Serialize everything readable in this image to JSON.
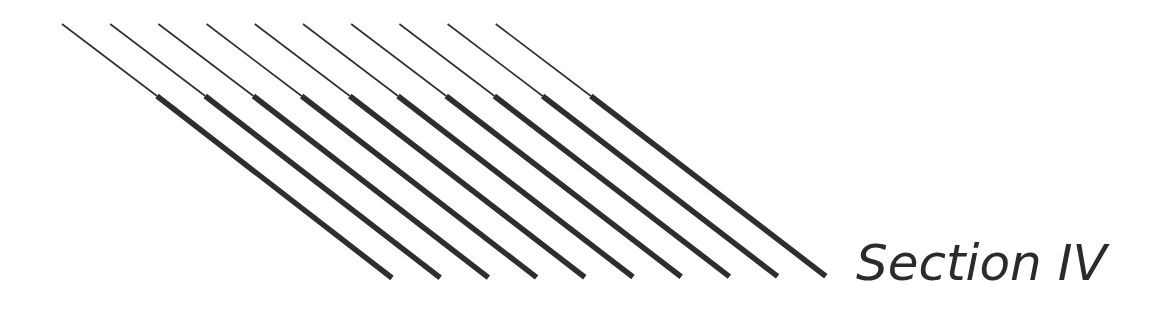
{
  "section": {
    "title": "Section IV"
  },
  "decoration": {
    "stroke_color": "#2e2e2e",
    "line_count": 10,
    "first_line": {
      "thin_start": [
        62,
        24
      ],
      "thick_start": [
        157,
        96
      ],
      "end": [
        392,
        278
      ]
    },
    "spacing_x": 48.2,
    "thin_width": 1.6,
    "thick_width": 5.5
  }
}
